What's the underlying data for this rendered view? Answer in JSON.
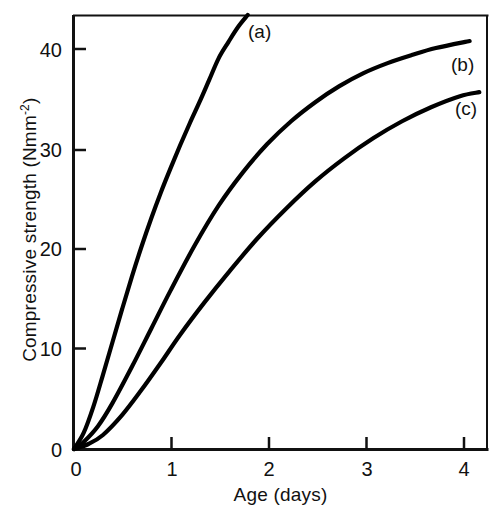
{
  "chart_data": {
    "type": "line",
    "title": "",
    "xlabel": "Age (days)",
    "ylabel": "Compressive strength (Nmm-2)",
    "ylabel_base": "Compressive strength (Nmm",
    "ylabel_sup": "-2",
    "ylabel_tail": ")",
    "xlim": [
      0,
      4.28
    ],
    "ylim": [
      0,
      43.3
    ],
    "grid": false,
    "legend_position": "inline-end-of-curve",
    "xticks": [
      0,
      1,
      2,
      3,
      4
    ],
    "xtick_labels": [
      "0",
      "1",
      "2",
      "3",
      "4"
    ],
    "yticks": [
      0,
      10,
      20,
      30,
      40
    ],
    "ytick_labels": [
      "0",
      "10",
      "20",
      "30",
      "40"
    ],
    "series": [
      {
        "name": "(a)",
        "label": "(a)",
        "color": "#000000",
        "x": [
          0,
          0.1,
          0.2,
          0.3,
          0.4,
          0.5,
          0.6,
          0.7,
          0.8,
          0.9,
          1.0,
          1.1,
          1.2,
          1.3,
          1.4,
          1.5,
          1.6,
          1.7,
          1.8
        ],
        "y": [
          0,
          1.6,
          4.2,
          7.4,
          10.7,
          14.0,
          17.2,
          20.2,
          23.0,
          25.6,
          28.0,
          30.3,
          32.5,
          34.6,
          36.8,
          39.0,
          40.6,
          42.1,
          43.3
        ]
      },
      {
        "name": "(b)",
        "label": "(b)",
        "color": "#000000",
        "x": [
          0,
          0.1,
          0.25,
          0.4,
          0.6,
          0.8,
          1.0,
          1.25,
          1.5,
          1.75,
          2.0,
          2.25,
          2.5,
          2.75,
          3.0,
          3.25,
          3.5,
          3.75,
          4.1
        ],
        "y": [
          0,
          0.7,
          2.3,
          4.6,
          8.2,
          12.0,
          15.8,
          20.3,
          24.3,
          27.6,
          30.4,
          32.7,
          34.6,
          36.2,
          37.5,
          38.5,
          39.3,
          40.0,
          40.7
        ]
      },
      {
        "name": "(c)",
        "label": "(c)",
        "color": "#000000",
        "x": [
          0,
          0.15,
          0.3,
          0.5,
          0.7,
          0.9,
          1.1,
          1.35,
          1.6,
          1.9,
          2.2,
          2.5,
          2.8,
          3.1,
          3.4,
          3.7,
          4.0,
          4.2
        ],
        "y": [
          0,
          0.5,
          1.4,
          3.4,
          5.9,
          8.6,
          11.4,
          14.6,
          17.6,
          21.0,
          24.0,
          26.7,
          29.0,
          31.0,
          32.7,
          34.1,
          35.2,
          35.6
        ]
      }
    ],
    "annotations": [
      {
        "text": "(a)",
        "x_px": 248,
        "y_px": 21
      },
      {
        "text": "(b)",
        "x_px": 451,
        "y_px": 54
      },
      {
        "text": "(c)",
        "x_px": 455,
        "y_px": 98
      }
    ]
  }
}
